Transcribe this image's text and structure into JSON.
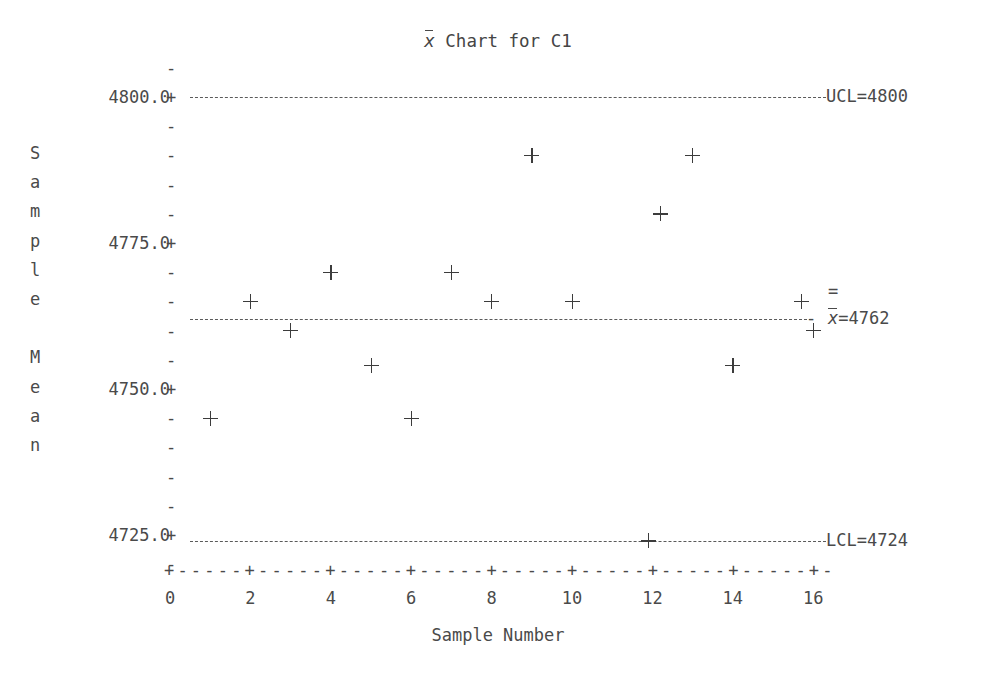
{
  "chart_data": {
    "type": "scatter",
    "title_parts": {
      "xbar_symbol": "x",
      "rest": " Chart for C1"
    },
    "xlabel": "Sample Number",
    "ylabel": "Sample Mean",
    "ylabel_letters": [
      "S",
      "a",
      "m",
      "p",
      "l",
      "e",
      "",
      "M",
      "e",
      "a",
      "n"
    ],
    "xlim": [
      0,
      16.6
    ],
    "ylim": [
      4721,
      4804
    ],
    "ytick_labels": [
      "4800.0",
      "4775.0",
      "4750.0",
      "4725.0"
    ],
    "ytick_values": [
      4800.0,
      4775.0,
      4750.0,
      4725.0
    ],
    "ytick_glyph": "+",
    "yminor_glyph": "-",
    "xtick_labels": [
      "0",
      "2",
      "4",
      "6",
      "8",
      "10",
      "12",
      "14",
      "16"
    ],
    "xtick_values": [
      0,
      2,
      4,
      6,
      8,
      10,
      12,
      14,
      16
    ],
    "xtick_glyph": "+",
    "xminor_glyph": "-",
    "grid": false,
    "marker": "+",
    "legend": false,
    "x": [
      1,
      2,
      3,
      4,
      5,
      6,
      7,
      8,
      9,
      10,
      11.9,
      12.2,
      13,
      14,
      15.7,
      16
    ],
    "values": [
      4745,
      4765,
      4760,
      4770,
      4754,
      4745,
      4770,
      4765,
      4790,
      4765,
      4724,
      4780,
      4790,
      4754,
      4765,
      4760
    ],
    "control_limits": {
      "ucl": {
        "value": 4800,
        "label": "UCL=4800",
        "display": "4800"
      },
      "center": {
        "value": 4762,
        "label": "x̄=4762",
        "display": "4762",
        "symbol": "x",
        "double_bar": "="
      },
      "lcl": {
        "value": 4724,
        "label": "LCL=4724",
        "display": "4724"
      }
    }
  },
  "axis_art": {
    "x_axis_spine": "+-----+-----+-----+-----+-----+-----+-----+-----+-",
    "ucl_dash_prefix": "-",
    "center_dash_prefix": "-"
  }
}
